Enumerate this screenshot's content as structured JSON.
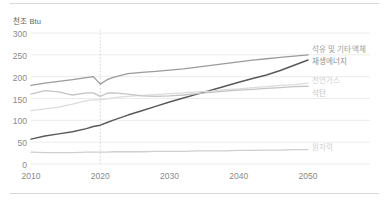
{
  "chart_data": {
    "type": "line",
    "title": "",
    "subtitle": "",
    "xlabel": "",
    "ylabel": "천조 Btu",
    "xlim": [
      2010,
      2050
    ],
    "ylim": [
      0,
      300
    ],
    "grid": true,
    "legend_position": "inline-right",
    "annotations": [
      {
        "type": "vline",
        "x": 2020,
        "style": "dotted",
        "label": ""
      }
    ],
    "x_ticks": [
      "2010",
      "2020",
      "2030",
      "2040",
      "2050"
    ],
    "y_ticks": [
      "0",
      "50",
      "100",
      "150",
      "200",
      "250",
      "300"
    ],
    "x": [
      2010,
      2012,
      2014,
      2016,
      2018,
      2019,
      2020,
      2021,
      2022,
      2024,
      2026,
      2028,
      2030,
      2032,
      2034,
      2036,
      2038,
      2040,
      2042,
      2044,
      2046,
      2048,
      2050
    ],
    "series": [
      {
        "name": "석유 및 기타 액체",
        "color": "#9b9b9b",
        "values": [
          180,
          185,
          189,
          193,
          198,
          200,
          183,
          193,
          199,
          207,
          210,
          212,
          215,
          218,
          222,
          226,
          230,
          234,
          238,
          241,
          244,
          247,
          250
        ]
      },
      {
        "name": "재생에너지",
        "color": "#595959",
        "values": [
          57,
          64,
          69,
          74,
          81,
          86,
          89,
          95,
          101,
          112,
          122,
          132,
          142,
          151,
          160,
          169,
          178,
          187,
          196,
          204,
          214,
          226,
          238
        ]
      },
      {
        "name": "천연가스",
        "color": "#dcdcdc",
        "values": [
          122,
          126,
          130,
          137,
          145,
          147,
          147,
          149,
          152,
          155,
          157,
          159,
          161,
          163,
          165,
          167,
          170,
          172,
          175,
          177,
          180,
          182,
          185
        ]
      },
      {
        "name": "석탄",
        "color": "#c4c4c4",
        "values": [
          160,
          168,
          165,
          158,
          163,
          163,
          155,
          162,
          163,
          160,
          156,
          155,
          156,
          158,
          161,
          164,
          167,
          169,
          171,
          173,
          175,
          177,
          178
        ]
      },
      {
        "name": "원자력",
        "color": "#cfcfcf",
        "values": [
          27,
          26,
          26,
          26,
          27,
          27,
          27,
          27,
          28,
          28,
          28,
          29,
          29,
          29,
          30,
          30,
          30,
          31,
          31,
          32,
          32,
          33,
          33
        ]
      }
    ]
  },
  "labels": {
    "petroleum": "석유 및 기타 액체",
    "renewables": "재생에너지",
    "natural_gas": "천연가스",
    "coal": "석탄",
    "nuclear": "원자력"
  },
  "axis": {
    "y_title": "천조 Btu",
    "y_ticks": [
      "300",
      "250",
      "200",
      "150",
      "100",
      "50",
      "0"
    ],
    "x_ticks": [
      "2010",
      "2020",
      "2030",
      "2040",
      "2050"
    ]
  },
  "colors": {
    "petroleum": "#9b9b9b",
    "renewables": "#595959",
    "natural_gas": "#dcdcdc",
    "coal": "#c4c4c4",
    "nuclear": "#cfcfcf",
    "grid": "#ececec",
    "tick_text": "#8a8a8a",
    "rule": "#d9d9d9"
  }
}
